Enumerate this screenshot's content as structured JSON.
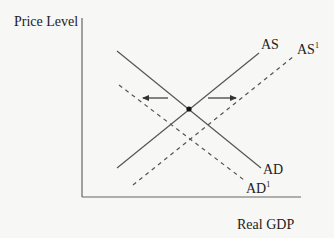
{
  "diagram": {
    "type": "AS-AD model",
    "y_axis_label": "Price Level",
    "x_axis_label": "Real GDP",
    "curves": [
      {
        "id": "AS",
        "label": "AS",
        "label_sup": "",
        "style": "solid",
        "x1": 117,
        "y1": 168,
        "x2": 259,
        "y2": 53
      },
      {
        "id": "AS1",
        "label": "AS",
        "label_sup": "1",
        "style": "dashed",
        "x1": 133,
        "y1": 185,
        "x2": 294,
        "y2": 56
      },
      {
        "id": "AD",
        "label": "AD",
        "label_sup": "",
        "style": "solid",
        "x1": 117,
        "y1": 51,
        "x2": 261,
        "y2": 168
      },
      {
        "id": "AD1",
        "label": "AD",
        "label_sup": "1",
        "style": "dashed",
        "x1": 119,
        "y1": 85,
        "x2": 244,
        "y2": 180
      }
    ],
    "equilibrium_point": {
      "x": 189,
      "y": 109
    },
    "arrows": [
      {
        "direction": "left",
        "x1": 168,
        "y1": 98,
        "x2": 143,
        "y2": 98
      },
      {
        "direction": "right",
        "x1": 208,
        "y1": 98,
        "x2": 236,
        "y2": 98
      }
    ],
    "colors": {
      "line": "#555555",
      "text": "#222222",
      "background": "#f7f7f5"
    }
  }
}
